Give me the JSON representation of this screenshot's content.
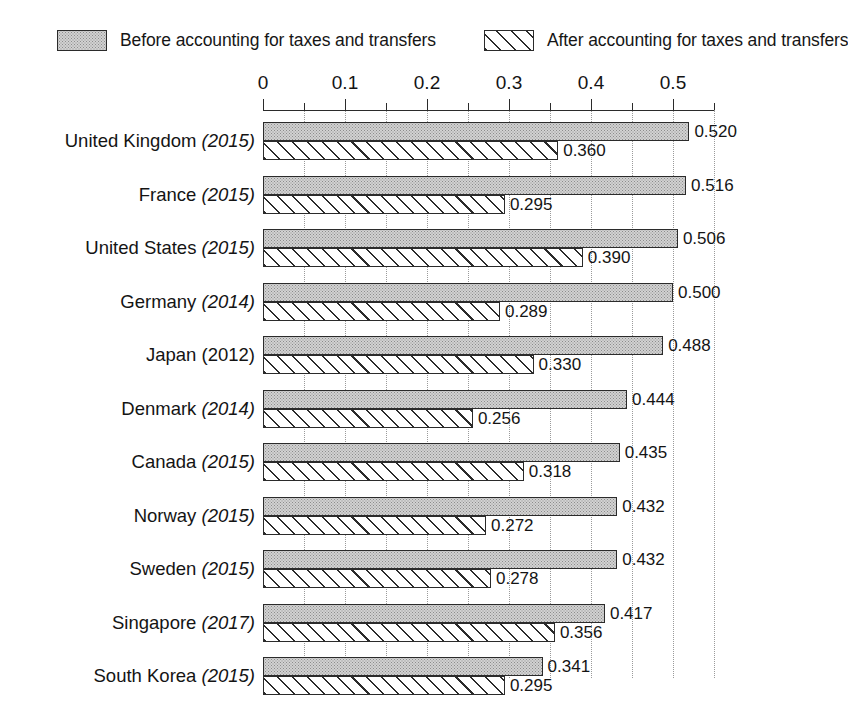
{
  "legend": {
    "items": [
      {
        "label": "Before accounting for taxes and transfers",
        "pattern": "gray-stipple-swatch",
        "key": "before"
      },
      {
        "label": "After accounting for taxes and transfers",
        "pattern": "diagonal-hatch-swatch",
        "key": "after"
      }
    ]
  },
  "axis": {
    "tick_labels": [
      "0",
      "0.1",
      "0.2",
      "0.3",
      "0.4",
      "0.5"
    ],
    "tick_values": [
      0,
      0.1,
      0.2,
      0.3,
      0.4,
      0.5
    ],
    "minor_tick_values": [
      0.05,
      0.15,
      0.25,
      0.35,
      0.45,
      0.55
    ],
    "gridline_values": [
      0.05,
      0.1,
      0.15,
      0.2,
      0.25,
      0.3,
      0.35,
      0.4,
      0.45,
      0.5,
      0.55
    ],
    "min": 0,
    "max": 0.55,
    "position": "top"
  },
  "chart_data": {
    "type": "bar",
    "orientation": "horizontal",
    "title": "",
    "subtitle": "",
    "xlabel": "",
    "ylabel": "",
    "xlim": [
      0,
      0.55
    ],
    "grid": true,
    "legend_position": "top",
    "categories": [
      "United Kingdom (2015)",
      "France (2015)",
      "United States (2015)",
      "Germany (2014)",
      "Japan (2012)",
      "Denmark (2014)",
      "Canada (2015)",
      "Norway (2015)",
      "Sweden (2015)",
      "Singapore (2017)",
      "South Korea (2015)"
    ],
    "series": [
      {
        "name": "Before accounting for taxes and transfers",
        "values": [
          0.52,
          0.516,
          0.506,
          0.5,
          0.488,
          0.444,
          0.435,
          0.432,
          0.432,
          0.417,
          0.341
        ]
      },
      {
        "name": "After accounting for taxes and transfers",
        "values": [
          0.36,
          0.295,
          0.39,
          0.289,
          0.33,
          0.256,
          0.318,
          0.272,
          0.278,
          0.356,
          0.295
        ]
      }
    ]
  },
  "rows": [
    {
      "country": "United Kingdom",
      "year": "(2015)",
      "year_italic": true,
      "before": 0.52,
      "after": 0.36,
      "before_label": "0.520",
      "after_label": "0.360"
    },
    {
      "country": "France",
      "year": "(2015)",
      "year_italic": true,
      "before": 0.516,
      "after": 0.295,
      "before_label": "0.516",
      "after_label": "0.295"
    },
    {
      "country": "United States",
      "year": "(2015)",
      "year_italic": true,
      "before": 0.506,
      "after": 0.39,
      "before_label": "0.506",
      "after_label": "0.390"
    },
    {
      "country": "Germany",
      "year": "(2014)",
      "year_italic": true,
      "before": 0.5,
      "after": 0.289,
      "before_label": "0.500",
      "after_label": "0.289"
    },
    {
      "country": "Japan",
      "year": "(2012)",
      "year_italic": false,
      "before": 0.488,
      "after": 0.33,
      "before_label": "0.488",
      "after_label": "0.330"
    },
    {
      "country": "Denmark",
      "year": "(2014)",
      "year_italic": true,
      "before": 0.444,
      "after": 0.256,
      "before_label": "0.444",
      "after_label": "0.256"
    },
    {
      "country": "Canada",
      "year": "(2015)",
      "year_italic": true,
      "before": 0.435,
      "after": 0.318,
      "before_label": "0.435",
      "after_label": "0.318"
    },
    {
      "country": "Norway",
      "year": "(2015)",
      "year_italic": true,
      "before": 0.432,
      "after": 0.272,
      "before_label": "0.432",
      "after_label": "0.272"
    },
    {
      "country": "Sweden",
      "year": "(2015)",
      "year_italic": true,
      "before": 0.432,
      "after": 0.278,
      "before_label": "0.432",
      "after_label": "0.278"
    },
    {
      "country": "Singapore",
      "year": "(2017)",
      "year_italic": true,
      "before": 0.417,
      "after": 0.356,
      "before_label": "0.417",
      "after_label": "0.356"
    },
    {
      "country": "South Korea",
      "year": "(2015)",
      "year_italic": true,
      "before": 0.341,
      "after": 0.295,
      "before_label": "0.341",
      "after_label": "0.295"
    }
  ],
  "colors": {
    "before_fill": "#d2d2d2",
    "after_fill": "#ffffff",
    "outline": "#2b2b2b",
    "gridline": "#9a9a9a",
    "text": "#141414",
    "background": "#ffffff"
  }
}
